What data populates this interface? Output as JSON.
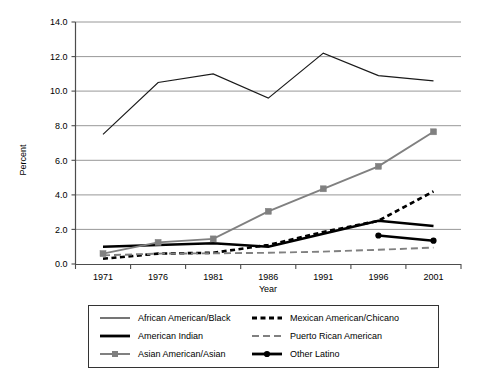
{
  "chart_data": {
    "type": "line",
    "title": "",
    "xlabel": "Year",
    "ylabel": "Percent",
    "categories": [
      "1971",
      "1976",
      "1981",
      "1986",
      "1991",
      "1996",
      "2001"
    ],
    "x": [
      1971,
      1976,
      1981,
      1986,
      1991,
      1996,
      2001
    ],
    "ylim": [
      0.0,
      14.0
    ],
    "ytick_labels": [
      "0.0",
      "2.0",
      "4.0",
      "6.0",
      "8.0",
      "10.0",
      "12.0",
      "14.0"
    ],
    "yticks": [
      0.0,
      2.0,
      4.0,
      6.0,
      8.0,
      10.0,
      12.0,
      14.0
    ],
    "grid": "horizontal",
    "legend_position": "bottom",
    "series": [
      {
        "name": "African American/Black",
        "style": "thin-solid",
        "color": "#1a1a1a",
        "marker": "none",
        "values": [
          7.5,
          10.5,
          11.0,
          9.6,
          12.2,
          10.9,
          10.6
        ]
      },
      {
        "name": "American Indian",
        "style": "thick-solid",
        "color": "#000000",
        "marker": "none",
        "values": [
          1.0,
          1.1,
          1.2,
          1.0,
          1.75,
          2.5,
          2.2
        ]
      },
      {
        "name": "Asian American/Asian",
        "style": "solid-square-marker",
        "color": "#808080",
        "marker": "square",
        "values": [
          0.6,
          1.25,
          1.45,
          3.05,
          4.35,
          5.65,
          7.65
        ]
      },
      {
        "name": "Mexican American/Chicano",
        "style": "thick-dashed",
        "color": "#000000",
        "marker": "none",
        "values": [
          0.3,
          0.6,
          0.65,
          1.1,
          1.85,
          2.5,
          4.2
        ]
      },
      {
        "name": "Puerto Rican American",
        "style": "gray-dashed",
        "color": "#808080",
        "marker": "none",
        "values": [
          0.5,
          0.6,
          0.62,
          0.65,
          0.72,
          0.82,
          0.95
        ]
      },
      {
        "name": "Other Latino",
        "style": "thick-solid-round-marker",
        "color": "#000000",
        "marker": "circle",
        "values": [
          null,
          null,
          null,
          null,
          null,
          1.65,
          1.35
        ]
      }
    ]
  },
  "legend": {
    "entries": [
      {
        "label": "African American/Black",
        "swatch": "thin-solid-line-swatch"
      },
      {
        "label": "Mexican American/Chicano",
        "swatch": "thick-dashed-line-swatch"
      },
      {
        "label": "American Indian",
        "swatch": "thick-solid-line-swatch"
      },
      {
        "label": "Puerto Rican American",
        "swatch": "gray-dashed-line-swatch"
      },
      {
        "label": "Asian American/Asian",
        "swatch": "gray-square-marker-line-swatch"
      },
      {
        "label": "Other Latino",
        "swatch": "thick-round-marker-line-swatch"
      }
    ]
  },
  "colors": {
    "black": "#000000",
    "dark": "#1a1a1a",
    "gray": "#808080",
    "gridline": "#8c8c8c",
    "axis": "#4d4d4d",
    "background": "#ffffff"
  }
}
